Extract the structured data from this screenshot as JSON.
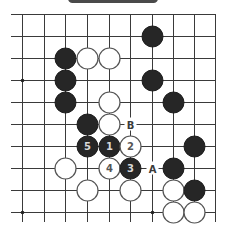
{
  "header": {
    "bar_color": "#4a4a4a"
  },
  "board": {
    "columns_x": [
      22,
      44,
      65,
      87,
      109,
      130,
      152,
      173,
      194,
      215
    ],
    "rows_y": [
      14,
      36,
      58,
      80,
      102,
      124,
      146,
      168,
      190,
      212
    ],
    "left_extent": 11,
    "bottom_extent": 222,
    "right_edge": true,
    "top_edge": true,
    "star_points": [
      {
        "col": 1,
        "row": 4
      },
      {
        "col": 1,
        "row": 10
      },
      {
        "col": 7,
        "row": 10
      }
    ],
    "stone_radius": 10.5,
    "stones": [
      {
        "color": "black",
        "col": 7,
        "row": 2
      },
      {
        "color": "black",
        "col": 3,
        "row": 3
      },
      {
        "color": "white",
        "col": 4,
        "row": 3
      },
      {
        "color": "white",
        "col": 5,
        "row": 3
      },
      {
        "color": "black",
        "col": 3,
        "row": 4
      },
      {
        "color": "black",
        "col": 7,
        "row": 4
      },
      {
        "color": "black",
        "col": 3,
        "row": 5
      },
      {
        "color": "white",
        "col": 5,
        "row": 5
      },
      {
        "color": "black",
        "col": 8,
        "row": 5
      },
      {
        "color": "black",
        "col": 4,
        "row": 6
      },
      {
        "color": "white",
        "col": 5,
        "row": 6
      },
      {
        "color": "black",
        "col": 4,
        "row": 7,
        "number": "5"
      },
      {
        "color": "black",
        "col": 5,
        "row": 7,
        "number": "1"
      },
      {
        "color": "white",
        "col": 6,
        "row": 7,
        "number": "2"
      },
      {
        "color": "black",
        "col": 9,
        "row": 7
      },
      {
        "color": "white",
        "col": 3,
        "row": 8
      },
      {
        "color": "white",
        "col": 5,
        "row": 8,
        "number": "4"
      },
      {
        "color": "black",
        "col": 6,
        "row": 8,
        "number": "3"
      },
      {
        "color": "black",
        "col": 8,
        "row": 8
      },
      {
        "color": "white",
        "col": 4,
        "row": 9
      },
      {
        "color": "white",
        "col": 6,
        "row": 9
      },
      {
        "color": "white",
        "col": 8,
        "row": 9
      },
      {
        "color": "black",
        "col": 9,
        "row": 9
      },
      {
        "color": "white",
        "col": 8,
        "row": 10
      },
      {
        "color": "white",
        "col": 9,
        "row": 10
      }
    ],
    "labels": [
      {
        "text": "B",
        "col": 6,
        "row": 6
      },
      {
        "text": "A",
        "col": 7,
        "row": 8
      }
    ]
  }
}
